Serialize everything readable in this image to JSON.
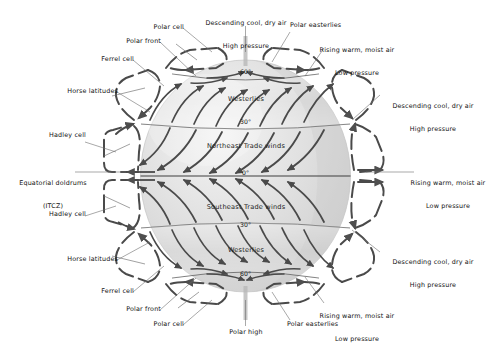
{
  "figure": {
    "type": "diagram",
    "background_color": "#ffffff",
    "globe_fill_color": "#dcdcdc",
    "globe_highlight_color": "#f2f2f2",
    "arrow_color": "#4a4a4a",
    "leader_line_color": "#6e6e6e",
    "text_color": "#111111"
  },
  "globe": {
    "latitude_labels": [
      {
        "id": "north-60",
        "text": "60°"
      },
      {
        "id": "north-30",
        "text": "30°"
      },
      {
        "id": "equator",
        "text": "0°"
      },
      {
        "id": "south-30",
        "text": "30°"
      },
      {
        "id": "south-60",
        "text": "60°"
      }
    ],
    "wind_belts": [
      {
        "id": "north-westerlies",
        "text": "Westerlies"
      },
      {
        "id": "northeast-trades",
        "text": "Northeast Trade winds"
      },
      {
        "id": "southeast-trades",
        "text": "Southeast Trade winds"
      },
      {
        "id": "south-westerlies",
        "text": "Westerlies"
      }
    ]
  },
  "annotations": {
    "top_left": [
      {
        "id": "polar-cell-n",
        "text": "Polar cell"
      },
      {
        "id": "polar-front-n",
        "text": "Polar front"
      },
      {
        "id": "ferrel-cell-n",
        "text": "Ferrel cell"
      },
      {
        "id": "horse-latitudes-n",
        "text": "Horse latitudes"
      }
    ],
    "top_center": [
      {
        "id": "descending-air-pole-n",
        "line1": "Descending cool, dry air",
        "line2": "High pressure"
      }
    ],
    "top_right": [
      {
        "id": "polar-easterlies-n",
        "text": "Polar easterlies"
      },
      {
        "id": "rising-air-60n",
        "line1": "Rising warm, moist air",
        "line2": "Low pressure"
      },
      {
        "id": "descending-air-30n",
        "line1": "Descending cool, dry air",
        "line2": "High pressure"
      }
    ],
    "left": [
      {
        "id": "hadley-cell-n",
        "text": "Hadley cell"
      },
      {
        "id": "equatorial-doldrums",
        "line1": "Equatorial doldrums",
        "line2": "(ITCZ)"
      },
      {
        "id": "hadley-cell-s",
        "text": "Hadley cell"
      }
    ],
    "right": [
      {
        "id": "rising-air-equator",
        "line1": "Rising warm, moist air",
        "line2": "Low pressure"
      },
      {
        "id": "descending-air-30s",
        "line1": "Descending cool, dry air",
        "line2": "High pressure"
      },
      {
        "id": "rising-air-60s",
        "line1": "Rising warm, moist air",
        "line2": "Low pressure"
      }
    ],
    "bottom_left": [
      {
        "id": "horse-latitudes-s",
        "text": "Horse latitudes"
      },
      {
        "id": "ferrel-cell-s",
        "text": "Ferrel cell"
      },
      {
        "id": "polar-front-s",
        "text": "Polar front"
      },
      {
        "id": "polar-cell-s",
        "text": "Polar cell"
      }
    ],
    "bottom_center": [
      {
        "id": "polar-high-s",
        "text": "Polar high"
      }
    ],
    "bottom_right": [
      {
        "id": "polar-easterlies-s",
        "text": "Polar easterlies"
      }
    ]
  }
}
